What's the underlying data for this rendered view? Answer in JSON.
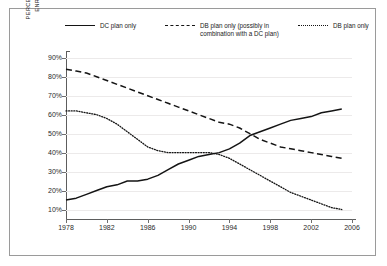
{
  "legend": {
    "items": [
      {
        "label": "DC plan only",
        "style": "solid"
      },
      {
        "label": "DB plan only (possibly in\ncombination with a DC plan)",
        "style": "dashed"
      },
      {
        "label": "DB plan only",
        "style": "dotted"
      }
    ]
  },
  "axes": {
    "ylabel": "PERCENTAGE OF ACTIVE WORKERS\nENROLLED IN A PENSION PLAN",
    "yticks": [
      "90%",
      "80%",
      "70%",
      "60%",
      "50%",
      "40%",
      "30%",
      "20%",
      "10%"
    ],
    "xticks": [
      "1978",
      "1982",
      "1986",
      "1990",
      "1994",
      "1998",
      "2002",
      "2006"
    ]
  },
  "chart_data": {
    "type": "line",
    "title": "",
    "xlabel": "",
    "ylabel": "PERCENTAGE OF ACTIVE WORKERS ENROLLED IN A PENSION PLAN",
    "xlim": [
      1978,
      2006
    ],
    "ylim": [
      5,
      92
    ],
    "grid": true,
    "legend_position": "top",
    "x": [
      1978,
      1979,
      1980,
      1981,
      1982,
      1983,
      1984,
      1985,
      1986,
      1987,
      1988,
      1989,
      1990,
      1991,
      1992,
      1993,
      1994,
      1995,
      1996,
      1997,
      1998,
      1999,
      2000,
      2001,
      2002,
      2003,
      2004,
      2005
    ],
    "series": [
      {
        "name": "DC plan only",
        "style": "solid",
        "color": "#141414",
        "values": [
          15,
          16,
          18,
          20,
          22,
          23,
          25,
          25,
          26,
          28,
          31,
          34,
          36,
          38,
          39,
          40,
          42,
          45,
          49,
          51,
          53,
          55,
          57,
          58,
          59,
          61,
          62,
          63
        ]
      },
      {
        "name": "DB plan only (possibly in combination with a DC plan)",
        "style": "dashed",
        "color": "#141414",
        "values": [
          84,
          83,
          82,
          80,
          78,
          76,
          74,
          72,
          70,
          68,
          66,
          64,
          62,
          60,
          58,
          56,
          55,
          53,
          50,
          47,
          45,
          43,
          42,
          41,
          40,
          39,
          38,
          37
        ]
      },
      {
        "name": "DB plan only",
        "style": "dotted",
        "color": "#141414",
        "values": [
          62,
          62,
          61,
          60,
          58,
          55,
          51,
          47,
          43,
          41,
          40,
          40,
          40,
          40,
          40,
          39,
          37,
          34,
          31,
          28,
          25,
          22,
          19,
          17,
          15,
          13,
          11,
          10
        ]
      }
    ]
  }
}
